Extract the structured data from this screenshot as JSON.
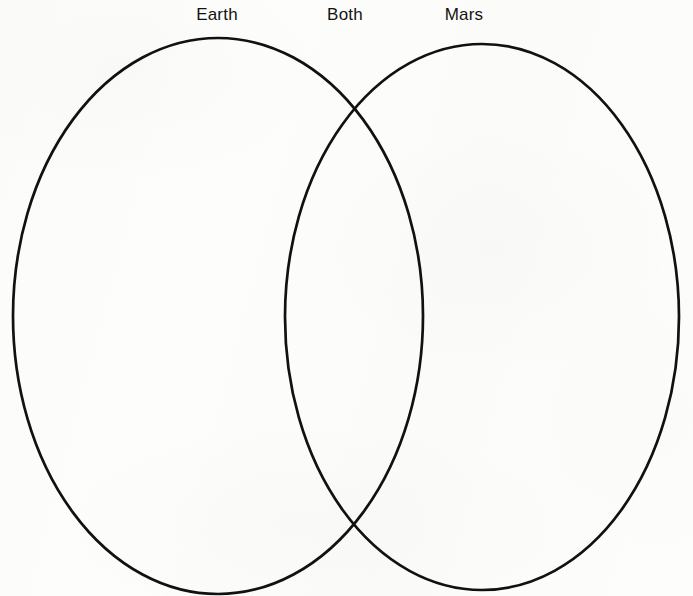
{
  "diagram": {
    "type": "venn",
    "title": "",
    "background_color": "#fdfdfc",
    "stroke_color": "#111111",
    "stroke_width": 2.7,
    "labels": {
      "left": "Earth",
      "overlap": "Both",
      "right": "Mars"
    },
    "sets": [
      {
        "name": "Earth",
        "label": "Earth",
        "items": [],
        "shape": "ellipse",
        "cx": 218,
        "cy": 316,
        "rx": 205,
        "ry": 278
      },
      {
        "name": "Mars",
        "label": "Mars",
        "items": [],
        "shape": "ellipse",
        "cx": 482,
        "cy": 317,
        "rx": 197,
        "ry": 273
      }
    ],
    "intersection": {
      "label": "Both",
      "items": []
    }
  }
}
